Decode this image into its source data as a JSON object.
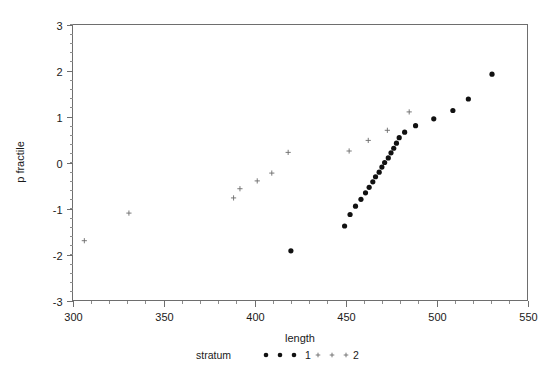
{
  "chart_data": {
    "type": "scatter",
    "title": "",
    "xlabel": "length",
    "ylabel": "p fractile",
    "xlim": [
      300,
      550
    ],
    "ylim": [
      -3,
      3
    ],
    "xticks": [
      300,
      350,
      400,
      450,
      500,
      550
    ],
    "xtick_labels": [
      "300",
      "350",
      "400",
      "450",
      "500",
      "550"
    ],
    "yticks": [
      -3,
      -2,
      -1,
      0,
      1,
      2,
      3
    ],
    "ytick_labels": [
      "-3",
      "-2",
      "-1",
      "0",
      "1",
      "2",
      "3"
    ],
    "x_minor_tick_step": 10,
    "y_minor_tick_step": 0.2,
    "grid": false,
    "legend_position": "bottom",
    "legend_title": "stratum",
    "series": [
      {
        "name": "1",
        "marker": "filled-circle",
        "color": "#111111",
        "points": [
          [
            420.0,
            -1.92
          ],
          [
            449.5,
            -1.38
          ],
          [
            452.5,
            -1.13
          ],
          [
            455.5,
            -0.95
          ],
          [
            458.5,
            -0.8
          ],
          [
            461.0,
            -0.66
          ],
          [
            463.0,
            -0.54
          ],
          [
            465.0,
            -0.42
          ],
          [
            466.5,
            -0.31
          ],
          [
            468.5,
            -0.21
          ],
          [
            470.0,
            -0.1
          ],
          [
            471.5,
            0.0
          ],
          [
            473.5,
            0.1
          ],
          [
            475.0,
            0.21
          ],
          [
            476.5,
            0.31
          ],
          [
            478.0,
            0.42
          ],
          [
            479.5,
            0.54
          ],
          [
            482.5,
            0.66
          ],
          [
            488.5,
            0.8
          ],
          [
            498.5,
            0.95
          ],
          [
            509.0,
            1.13
          ],
          [
            517.5,
            1.38
          ],
          [
            530.5,
            1.92
          ]
        ]
      },
      {
        "name": "2",
        "marker": "cross",
        "color": "#6b6b6b",
        "points": [
          [
            306.5,
            -1.7
          ],
          [
            331.0,
            -1.1
          ],
          [
            388.5,
            -0.77
          ],
          [
            392.0,
            -0.57
          ],
          [
            401.5,
            -0.4
          ],
          [
            409.5,
            -0.23
          ],
          [
            418.5,
            0.22
          ],
          [
            452.0,
            0.25
          ],
          [
            462.5,
            0.48
          ],
          [
            473.0,
            0.7
          ],
          [
            485.0,
            1.1
          ]
        ]
      }
    ]
  },
  "legend": {
    "title": "stratum",
    "entries": [
      {
        "label": "1",
        "marker": "filled-circle"
      },
      {
        "label": "2",
        "marker": "cross"
      }
    ]
  },
  "colors": {
    "axis": "#6e6e6e",
    "text": "#1a1a1a",
    "series1": "#111111",
    "series2": "#6b6b6b",
    "background": "#ffffff"
  }
}
